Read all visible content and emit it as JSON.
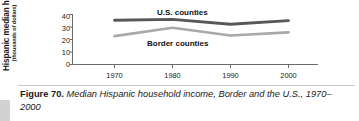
{
  "figure": {
    "number_label": "Figure 70.",
    "caption_text": "Median Hispanic household income, Border and the U.S., 1970–2000"
  },
  "chart_data": {
    "type": "line",
    "title": "",
    "xlabel": "",
    "ylabel": "Hispanic median household income",
    "ylabel_sub": "(thousands of dollars)",
    "x": [
      1970,
      1980,
      1990,
      2000
    ],
    "xticklabels": [
      "1970",
      "1980",
      "1990",
      "2000"
    ],
    "yticks": [
      0,
      10,
      20,
      30,
      40
    ],
    "yticklabels": [
      "0",
      "10",
      "20",
      "30",
      "40"
    ],
    "ylim": [
      0,
      40
    ],
    "xlim": [
      1963,
      2008
    ],
    "grid": false,
    "legend_position": "inline-labels",
    "series": [
      {
        "name": "U.S. counties",
        "values": [
          35.4,
          36.1,
          32.2,
          35.1
        ],
        "color": "#58585a"
      },
      {
        "name": "Border counties",
        "values": [
          22.7,
          29.4,
          23.2,
          25.7
        ],
        "color": "#a9a9ab"
      }
    ]
  },
  "colors": {
    "us_counties_line": "#58585a",
    "border_counties_line": "#a9a9ab",
    "axis": "#6b6b6b",
    "text": "#1a1a1a",
    "rule": "#c9c9c9"
  }
}
